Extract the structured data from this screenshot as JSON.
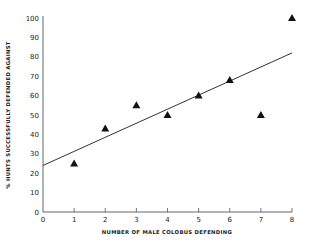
{
  "chart_data": {
    "type": "scatter",
    "title": "",
    "xlabel": "NUMBER OF MALE COLOBUS DEFENDING",
    "ylabel": "% HUNTS SUCCESSFULLY DEFENDED AGAINST",
    "xlim": [
      0,
      8
    ],
    "ylim": [
      0,
      100
    ],
    "x_ticks": [
      "0",
      "1",
      "2",
      "3",
      "4",
      "5",
      "6",
      "7",
      "8"
    ],
    "y_ticks": [
      "0",
      "10",
      "20",
      "30",
      "40",
      "50",
      "60",
      "70",
      "80",
      "90",
      "100"
    ],
    "grid": false,
    "legend": null,
    "marker": "triangle",
    "series": [
      {
        "name": "observations",
        "x": [
          1,
          2,
          3,
          4,
          5,
          6,
          7,
          8
        ],
        "y": [
          25,
          43,
          55,
          50,
          60,
          68,
          50,
          100
        ]
      }
    ],
    "trendline": {
      "type": "linear",
      "x": [
        0,
        8
      ],
      "y": [
        24,
        82
      ]
    }
  }
}
